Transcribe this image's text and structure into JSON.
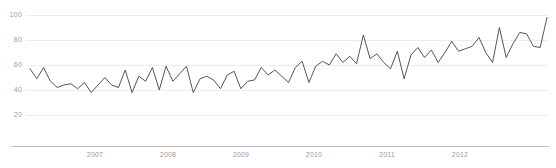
{
  "chart_data": {
    "type": "line",
    "title": "",
    "xlabel": "",
    "ylabel": "",
    "grid": true,
    "legend": false,
    "ylim": [
      0,
      108
    ],
    "yticks": [
      20,
      40,
      60,
      80,
      100
    ],
    "ytick_labels": [
      "20",
      "40",
      "60",
      "80",
      "100"
    ],
    "xtick_labels": [
      "2007",
      "2008",
      "2009",
      "2010",
      "2011",
      "2012"
    ],
    "xticks_x_px": [
      95,
      168,
      241,
      314,
      387,
      460
    ],
    "xlim_px": [
      30,
      547
    ],
    "line_color": "#555555",
    "grid_color": "#ececec",
    "axis_color": "#bdbdbd",
    "tick_text_color": "#9a9a9a",
    "x": [
      0,
      1,
      2,
      3,
      4,
      5,
      6,
      7,
      8,
      9,
      10,
      11,
      12,
      13,
      14,
      15,
      16,
      17,
      18,
      19,
      20,
      21,
      22,
      23,
      24,
      25,
      26,
      27,
      28,
      29,
      30,
      31,
      32,
      33,
      34,
      35,
      36,
      37,
      38,
      39,
      40,
      41,
      42,
      43,
      44,
      45,
      46,
      47,
      48,
      49,
      50,
      51,
      52,
      53,
      54,
      55,
      56,
      57,
      58,
      59,
      60,
      61,
      62,
      63,
      64,
      65,
      66,
      67,
      68,
      69,
      70,
      71,
      72,
      73,
      74,
      75,
      76
    ],
    "values": [
      57,
      49,
      58,
      47,
      42,
      44,
      45,
      41,
      46,
      38,
      44,
      50,
      44,
      42,
      56,
      38,
      51,
      47,
      58,
      40,
      59,
      47,
      53,
      59,
      38,
      49,
      51,
      48,
      41,
      52,
      55,
      41,
      47,
      48,
      58,
      52,
      56,
      51,
      46,
      58,
      63,
      46,
      59,
      63,
      60,
      69,
      62,
      67,
      61,
      84,
      65,
      69,
      62,
      57,
      71,
      49,
      68,
      74,
      66,
      72,
      62,
      70,
      79,
      71,
      73,
      75,
      82,
      70,
      62,
      90,
      66,
      77,
      86,
      85,
      75,
      74,
      98
    ],
    "series": [
      {
        "name": "value",
        "values": [
          57,
          49,
          58,
          47,
          42,
          44,
          45,
          41,
          46,
          38,
          44,
          50,
          44,
          42,
          56,
          38,
          51,
          47,
          58,
          40,
          59,
          47,
          53,
          59,
          38,
          49,
          51,
          48,
          41,
          52,
          55,
          41,
          47,
          48,
          58,
          52,
          56,
          51,
          46,
          58,
          63,
          46,
          59,
          63,
          60,
          69,
          62,
          67,
          61,
          84,
          65,
          69,
          62,
          57,
          71,
          49,
          68,
          74,
          66,
          72,
          62,
          70,
          79,
          71,
          73,
          75,
          82,
          70,
          62,
          90,
          66,
          77,
          86,
          85,
          75,
          74,
          98
        ]
      }
    ]
  }
}
